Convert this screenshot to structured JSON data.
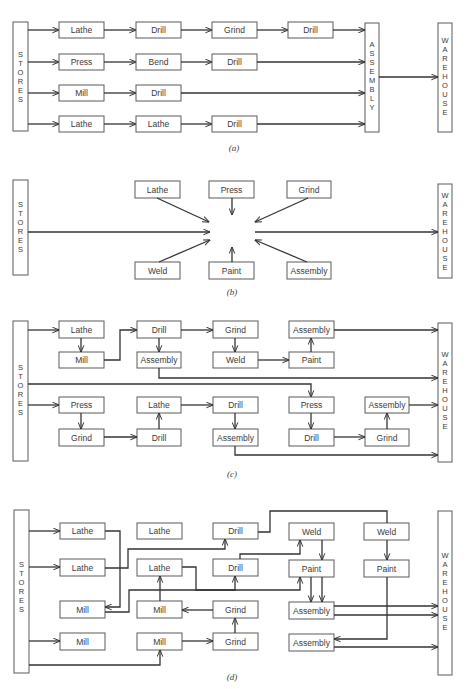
{
  "figure": {
    "panels": [
      {
        "id": "a",
        "caption": "(a)",
        "stores_label": "STORES",
        "assembly_label": "ASSEMBLY",
        "warehouse_label": "WAREHOUSE",
        "rows": [
          [
            "Lathe",
            "Drill",
            "Grind",
            "Drill"
          ],
          [
            "Press",
            "Bend",
            "Drill"
          ],
          [
            "Mill",
            "Drill"
          ],
          [
            "Lathe",
            "Lathe",
            "Drill"
          ]
        ]
      },
      {
        "id": "b",
        "caption": "(b)",
        "stores_label": "STORES",
        "warehouse_label": "WAREHOUSE",
        "top": [
          "Lathe",
          "Press",
          "Grind"
        ],
        "bottom": [
          "Weld",
          "Paint",
          "Assembly"
        ]
      },
      {
        "id": "c",
        "caption": "(c)",
        "stores_label": "STORES",
        "warehouse_label": "WAREHOUSE",
        "nodes": {
          "r1": [
            "Lathe",
            "Drill",
            "Grind",
            "Assembly"
          ],
          "r2": [
            "Mill",
            "Assembly",
            "Weld",
            "Paint"
          ],
          "r3": [
            "Press",
            "Lathe",
            "Drill",
            "Press",
            "Assembly"
          ],
          "r4": [
            "Grind",
            "Drill",
            "Assembly",
            "Drill",
            "Grind"
          ]
        }
      },
      {
        "id": "d",
        "caption": "(d)",
        "stores_label": "STORES",
        "warehouse_label": "WAREHOUSE",
        "nodes": {
          "r1": [
            "Lathe",
            "Lathe",
            "Drill",
            "Weld",
            "Weld"
          ],
          "r2": [
            "Lathe",
            "Lathe",
            "Drill",
            "Paint",
            "Paint"
          ],
          "r3": [
            "Mill",
            "Mill",
            "Grind",
            "Assembly"
          ],
          "r4": [
            "Mill",
            "Mill",
            "Grind",
            "Assembly"
          ]
        }
      }
    ]
  }
}
